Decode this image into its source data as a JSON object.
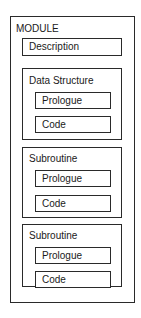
{
  "diagram": {
    "module": {
      "title": "MODULE",
      "description": "Description",
      "sections": [
        {
          "title": "Data Structure",
          "items": [
            "Prologue",
            "Code"
          ]
        },
        {
          "title": "Subroutine",
          "items": [
            "Prologue",
            "Code"
          ]
        },
        {
          "title": "Subroutine",
          "items": [
            "Prologue",
            "Code"
          ]
        }
      ]
    }
  }
}
